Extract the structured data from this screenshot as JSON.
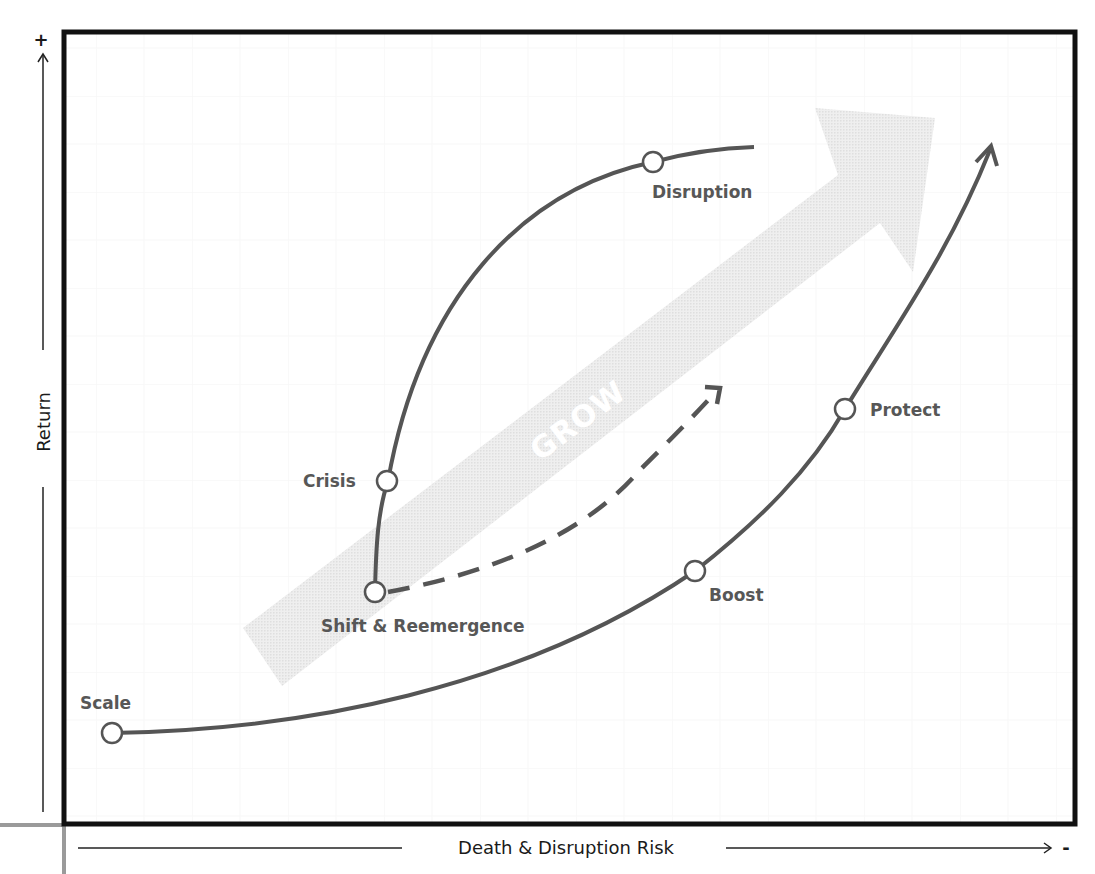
{
  "title_partial": "",
  "axes": {
    "y_label": "Return",
    "y_plus_marker": "+",
    "x_label": "Death & Disruption Risk",
    "x_minus_marker": "-"
  },
  "band": {
    "label": "GROW"
  },
  "nodes": {
    "scale": "Scale",
    "shift": "Shift & Reemergence",
    "crisis": "Crisis",
    "disruption": "Disruption",
    "boost": "Boost",
    "protect": "Protect"
  },
  "colors": {
    "frame": "#111111",
    "curve": "#555555",
    "band": "#e6e6e6",
    "node_fill": "#ffffff",
    "label": "#575757",
    "grid": "#f2f2f2"
  }
}
